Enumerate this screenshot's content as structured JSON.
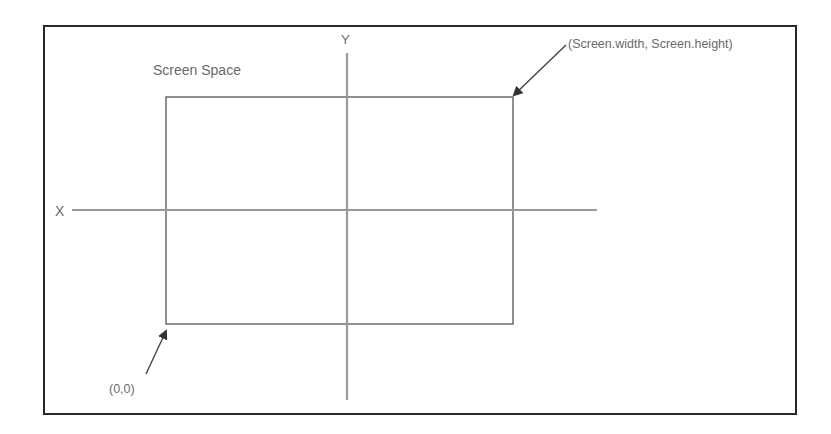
{
  "diagram": {
    "title": "Screen Space",
    "axes": {
      "x_label": "X",
      "y_label": "Y"
    },
    "corners": {
      "top_right": "(Screen.width, Screen.height)",
      "bottom_left": "(0,0)"
    },
    "colors": {
      "frame": "#2a2a2a",
      "rect": "#555555",
      "axis": "#9a9a9a",
      "arrow": "#444444",
      "text": "#6a6a6a",
      "background": "#ffffff"
    }
  }
}
